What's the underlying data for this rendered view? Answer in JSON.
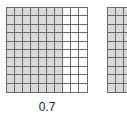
{
  "diagram": {
    "type": "decimal-grid-model",
    "grids": [
      {
        "id": "grid-a",
        "rows": 10,
        "cols": 10,
        "shaded_columns": 7,
        "label": "0.7",
        "shade_color": "#d9d9d9",
        "line_color": "#6a6a6a"
      },
      {
        "id": "grid-b",
        "rows": 10,
        "cols": 10,
        "shaded_columns": 10,
        "label": "",
        "shade_color": "#d9d9d9",
        "line_color": "#6a6a6a",
        "partially_visible": true
      }
    ]
  }
}
